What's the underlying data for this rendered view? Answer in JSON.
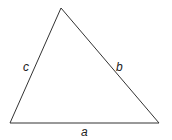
{
  "diagram": {
    "type": "triangle",
    "stroke_color": "#333333",
    "background": "#ffffff",
    "vertices": {
      "top": [
        61,
        8
      ],
      "bottom_left": [
        10,
        123
      ],
      "bottom_right": [
        159,
        123
      ]
    },
    "sides": [
      {
        "name": "a",
        "label": "a",
        "between": [
          "bottom_left",
          "bottom_right"
        ]
      },
      {
        "name": "b",
        "label": "b",
        "between": [
          "top",
          "bottom_right"
        ]
      },
      {
        "name": "c",
        "label": "c",
        "between": [
          "top",
          "bottom_left"
        ]
      }
    ]
  }
}
